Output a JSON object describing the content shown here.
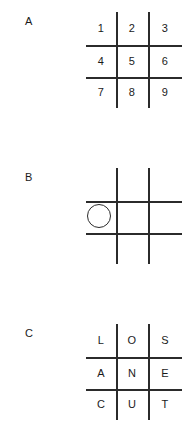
{
  "figure": {
    "background_color": "#ffffff",
    "ink_color": "#2b2b2b",
    "text_color": "#1a1a1a"
  },
  "panels": [
    {
      "label": "A",
      "grid_type": "tic-tac-toe-hash",
      "cells": [
        [
          "1",
          "2",
          "3"
        ],
        [
          "4",
          "5",
          "6"
        ],
        [
          "7",
          "8",
          "9"
        ]
      ],
      "tokens": []
    },
    {
      "label": "B",
      "grid_type": "tic-tac-toe-hash",
      "cells": [
        [
          "",
          "",
          ""
        ],
        [
          "",
          "",
          ""
        ],
        [
          "",
          "",
          ""
        ]
      ],
      "tokens": [
        {
          "shape": "circle",
          "mark": "O",
          "row": 1,
          "col": 0
        }
      ]
    },
    {
      "label": "C",
      "grid_type": "tic-tac-toe-hash",
      "cells": [
        [
          "L",
          "O",
          "S"
        ],
        [
          "A",
          "N",
          "E"
        ],
        [
          "C",
          "U",
          "T"
        ]
      ],
      "tokens": []
    }
  ]
}
